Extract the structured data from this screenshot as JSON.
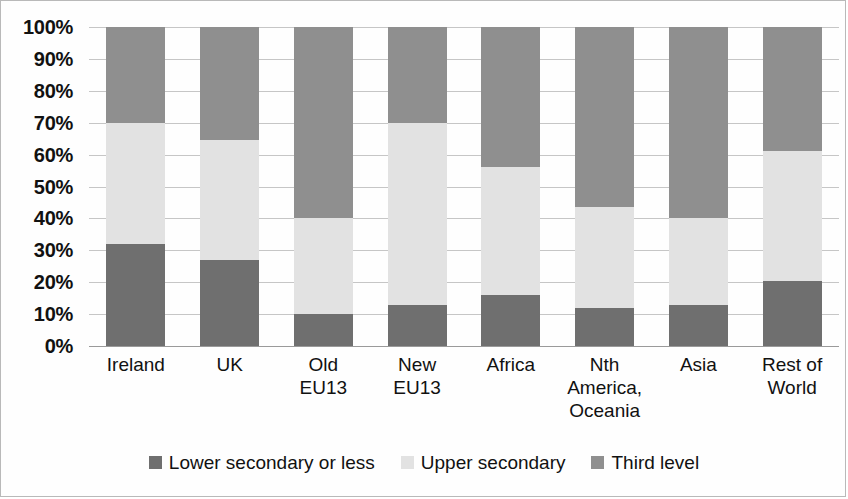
{
  "chart_data": {
    "type": "bar",
    "subtype": "stacked-percent",
    "title": "",
    "xlabel": "",
    "ylabel": "",
    "ylim": [
      0,
      100
    ],
    "ytick_labels": [
      "100%",
      "90%",
      "80%",
      "70%",
      "60%",
      "50%",
      "40%",
      "30%",
      "20%",
      "10%",
      "0%"
    ],
    "ytick_values": [
      100,
      90,
      80,
      70,
      60,
      50,
      40,
      30,
      20,
      10,
      0
    ],
    "grid": true,
    "legend_position": "bottom",
    "categories": [
      "Ireland",
      "UK",
      "Old\nEU13",
      "New\nEU13",
      "Africa",
      "Nth\nAmerica,\nOceania",
      "Asia",
      "Rest of\nWorld"
    ],
    "series": [
      {
        "name": "Lower secondary or less",
        "color": "#6f6f6f",
        "values": [
          32,
          27,
          10,
          13,
          16,
          12,
          13,
          20.5
        ]
      },
      {
        "name": "Upper secondary",
        "color": "#e2e2e2",
        "values": [
          38,
          37.5,
          30,
          57,
          40,
          31.5,
          27,
          40.5
        ]
      },
      {
        "name": "Third level",
        "color": "#8f8f8f",
        "values": [
          30,
          35.5,
          60,
          30,
          44,
          56.5,
          60,
          39
        ]
      }
    ]
  },
  "legend": {
    "items": [
      {
        "label": "Lower secondary or less",
        "color": "#6f6f6f",
        "swatch": "square-marker"
      },
      {
        "label": "Upper secondary",
        "color": "#e2e2e2",
        "swatch": "square-marker"
      },
      {
        "label": "Third level",
        "color": "#8f8f8f",
        "swatch": "square-marker"
      }
    ]
  }
}
